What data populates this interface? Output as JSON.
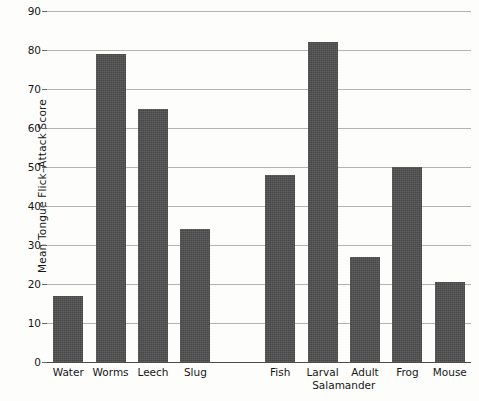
{
  "chart_data": {
    "type": "bar",
    "title": "",
    "xlabel": "",
    "ylabel": "Mean Tongue Flick–Attack Score",
    "ylim": [
      0,
      90
    ],
    "yticks": [
      0,
      10,
      20,
      30,
      40,
      50,
      60,
      70,
      80,
      90
    ],
    "ytick_labels": [
      "0",
      "10",
      "20",
      "30",
      "40",
      "50",
      "60",
      "70",
      "80",
      "90"
    ],
    "grid": true,
    "legend": "none",
    "categories": [
      "Water",
      "Worms",
      "Leech",
      "Slug",
      "Fish",
      "Larval",
      "Adult",
      "Frog",
      "Mouse"
    ],
    "values": [
      17,
      79,
      65,
      34,
      48,
      82,
      27,
      50,
      20.5
    ],
    "group_labels": [
      {
        "text": "Salamander",
        "spans": [
          "Larval",
          "Adult"
        ]
      }
    ],
    "gap_after": "Slug",
    "bar_color": "#4d4d4d",
    "axis_color": "#4c4c4c",
    "grid_color": "#9a9a9a",
    "background_color": "#fdfdfc"
  }
}
